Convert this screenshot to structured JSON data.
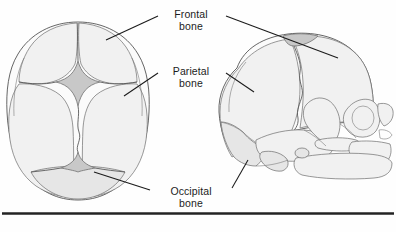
{
  "figure": {
    "views": [
      {
        "name": "superior-view",
        "description": "Superior (top) view of infant skull"
      },
      {
        "name": "lateral-view",
        "description": "Lateral (side) view of infant skull"
      }
    ],
    "ink_color": "#1b1b1b",
    "bone_fill": "#fbfbfb",
    "fontanelle_fill": "#c8c8c8",
    "rule_color": "#232323"
  },
  "labels": {
    "frontal": {
      "line1": "Frontal",
      "line2": "bone"
    },
    "parietal": {
      "line1": "Parietal",
      "line2": "bone"
    },
    "occipital": {
      "line1": "Occipital",
      "line2": "bone"
    }
  }
}
